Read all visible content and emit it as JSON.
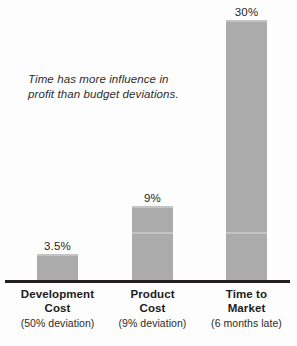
{
  "chart_data": {
    "type": "bar",
    "title": "",
    "subtitle": "",
    "xlabel": "",
    "ylabel": "",
    "ylim": [
      0,
      33
    ],
    "grid": false,
    "legend": "none",
    "orientation": "vertical",
    "bar_color": "#ababab",
    "axis_color": "#231f1e",
    "background": "#fdfdfd",
    "categories": [
      "Development Cost",
      "Product Cost",
      "Time to Market"
    ],
    "values": [
      3.5,
      9,
      30
    ],
    "value_labels": [
      "3.5%",
      "9%",
      "30%"
    ],
    "category_sublabels": [
      "(50% deviation)",
      "(9% deviation)",
      "(6 months late)"
    ],
    "annotation": "Time has more influence in profit than budget deviations."
  },
  "annotation": {
    "line1": "Time has more influence in",
    "line2": "profit than budget deviations."
  },
  "bars": [
    {
      "value_label": "3.5%",
      "name_line1": "Development",
      "name_line2": "Cost",
      "sublabel": "(50% deviation)"
    },
    {
      "value_label": "9%",
      "name_line1": "Product",
      "name_line2": "Cost",
      "sublabel": "(9% deviation)"
    },
    {
      "value_label": "30%",
      "name_line1": "Time to",
      "name_line2": "Market",
      "sublabel": "(6 months late)"
    }
  ]
}
